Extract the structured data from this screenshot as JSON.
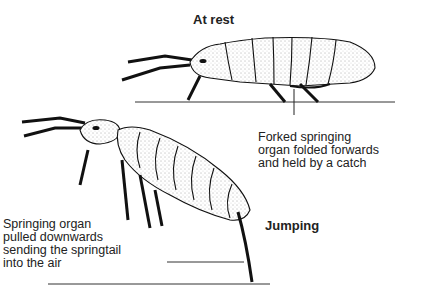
{
  "diagram": {
    "subject": "Springtail",
    "panels": [
      {
        "title": "At rest",
        "annotation": [
          "Forked springing",
          "organ folded forwards",
          "and held by a catch"
        ]
      },
      {
        "title": "Jumping",
        "annotation": [
          "Springing organ",
          "pulled downwards",
          "sending the springtail",
          "into the air"
        ]
      }
    ]
  }
}
